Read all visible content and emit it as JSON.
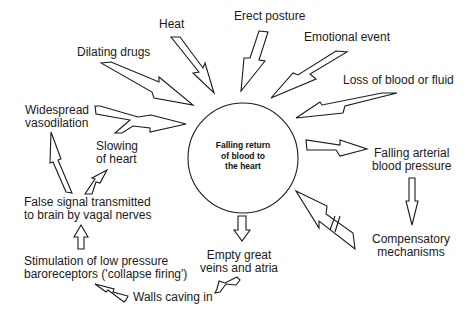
{
  "diagram": {
    "center": {
      "label_line1": "Falling return",
      "label_line2": "of blood to",
      "label_line3": "the heart"
    },
    "causes": [
      {
        "label": "Heat"
      },
      {
        "label": "Erect posture"
      },
      {
        "label": "Emotional event"
      },
      {
        "label": "Loss of blood or fluid"
      },
      {
        "label": "Dilating drugs"
      }
    ],
    "nodes": {
      "widespread_vasodilation": {
        "line1": "Widespread",
        "line2": "vasodilation"
      },
      "slowing_of_heart": {
        "line1": "Slowing",
        "line2": "of heart"
      },
      "false_signal": {
        "line1": "False signal transmitted",
        "line2": "to brain by vagal nerves"
      },
      "stimulation": {
        "line1": "Stimulation of low pressure",
        "line2": "baroreceptors ('collapse firing')"
      },
      "walls_caving": {
        "line1": "Walls caving in"
      },
      "empty_veins": {
        "line1": "Empty great",
        "line2": "veins and atria"
      },
      "falling_arterial": {
        "line1": "Falling arterial",
        "line2": "blood pressure"
      },
      "compensatory": {
        "line1": "Compensatory",
        "line2": "mechanisms"
      }
    },
    "colors": {
      "stroke": "#1a1a1a",
      "background": "#ffffff"
    }
  }
}
